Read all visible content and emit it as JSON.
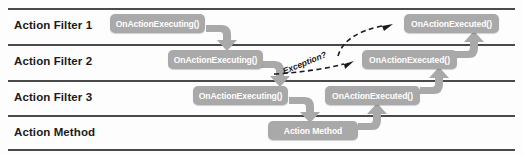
{
  "diagram": {
    "type": "swimlane-sequence",
    "colors": {
      "node_fill": "#a9a9a9",
      "node_text": "#ffffff",
      "lane_line": "#4a4a4a",
      "arrow": "#a9a9a9",
      "dashed_arrow": "#1b1b1b",
      "background": "#fdfdfd"
    },
    "lanes": [
      {
        "label": "Action Filter 1"
      },
      {
        "label": "Action Filter 2"
      },
      {
        "label": "Action Filter 3"
      },
      {
        "label": "Action Method"
      }
    ],
    "nodes": [
      {
        "label": "OnActionExecuting()",
        "lane": 0,
        "x": 110,
        "y": 14,
        "w": 95,
        "h": 19
      },
      {
        "label": "OnActionExecuting()",
        "lane": 1,
        "x": 168,
        "y": 50,
        "w": 95,
        "h": 19
      },
      {
        "label": "OnActionExecuting()",
        "lane": 2,
        "x": 193,
        "y": 86,
        "w": 95,
        "h": 19
      },
      {
        "label": "Action Method",
        "lane": 3,
        "x": 268,
        "y": 121,
        "w": 90,
        "h": 19
      },
      {
        "label": "OnActionExecuted()",
        "lane": 2,
        "x": 325,
        "y": 86,
        "w": 95,
        "h": 19
      },
      {
        "label": "OnActionExecuted()",
        "lane": 1,
        "x": 362,
        "y": 50,
        "w": 95,
        "h": 19
      },
      {
        "label": "OnActionExecuted()",
        "lane": 0,
        "x": 404,
        "y": 14,
        "w": 95,
        "h": 19
      }
    ],
    "annotations": [
      {
        "label": "Exception?",
        "x": 285,
        "y": 66
      }
    ],
    "connectors": [
      {
        "kind": "hook-down",
        "from": "OnActionExecuting() (Filter 1)",
        "to": "OnActionExecuting() (Filter 2)"
      },
      {
        "kind": "hook-down",
        "from": "OnActionExecuting() (Filter 2)",
        "to": "OnActionExecuting() (Filter 3)"
      },
      {
        "kind": "hook-down",
        "from": "OnActionExecuting() (Filter 3)",
        "to": "Action Method"
      },
      {
        "kind": "hook-up",
        "from": "Action Method",
        "to": "OnActionExecuted() (Filter 3)"
      },
      {
        "kind": "hook-up",
        "from": "OnActionExecuted() (Filter 3)",
        "to": "OnActionExecuted() (Filter 2)"
      },
      {
        "kind": "hook-up",
        "from": "OnActionExecuted() (Filter 2)",
        "to": "OnActionExecuted() (Filter 1)"
      },
      {
        "kind": "dashed",
        "from": "OnActionExecuting() (Filter 3)",
        "to": "OnActionExecuted() (Filter 2)",
        "label": "Exception?"
      },
      {
        "kind": "dashed",
        "from": "OnActionExecuted() (Filter 2)",
        "to": "OnActionExecuted() (Filter 1)"
      }
    ]
  }
}
